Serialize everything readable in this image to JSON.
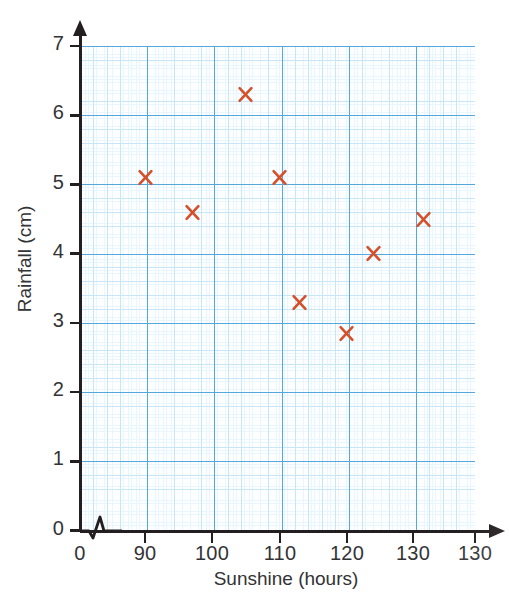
{
  "figure": {
    "kind": "scatter-graph",
    "background_color": "#ffffff",
    "grid_major_color": "#55a8de",
    "grid_medium_color": "#c9e6f7",
    "grid_fine_color": "#eaf6fd",
    "axis_color": "#231f20",
    "marker_color": "#d4502a",
    "axis_break_symbol": "zigzag"
  },
  "chart_data": {
    "type": "scatter",
    "title": "",
    "xlabel": "Sunshine (hours)",
    "ylabel": "Rainfall (cm)",
    "xlim": [
      85,
      143.5
    ],
    "ylim": [
      0,
      7
    ],
    "grid": true,
    "legend": "none",
    "x_tick_labels": [
      "0",
      "90",
      "100",
      "110",
      "120",
      "130",
      "130"
    ],
    "y_tick_labels": [
      "0",
      "1",
      "2",
      "3",
      "4",
      "5",
      "6",
      "7"
    ],
    "x_axis_break_after_origin": true,
    "marker_style": "x",
    "marker_color": "#d4502a",
    "points": [
      {
        "x": 90,
        "y": 5.1,
        "label": "90, 5.1"
      },
      {
        "x": 97,
        "y": 4.6,
        "label": "97, 4.6"
      },
      {
        "x": 105,
        "y": 6.3,
        "label": "105, 6.3"
      },
      {
        "x": 110,
        "y": 5.1,
        "label": "110, 5.1"
      },
      {
        "x": 113,
        "y": 3.3,
        "label": "113, 3.3"
      },
      {
        "x": 120,
        "y": 2.85,
        "label": "120, 2.85"
      },
      {
        "x": 124,
        "y": 4.0,
        "label": "124, 4.0"
      },
      {
        "x": 131.5,
        "y": 4.5,
        "label": "131.5, 4.5"
      }
    ]
  },
  "axes": {
    "y": {
      "title": "Rainfall (cm)",
      "ticks": [
        {
          "label": "7",
          "value": 7
        },
        {
          "label": "6",
          "value": 6
        },
        {
          "label": "5",
          "value": 5
        },
        {
          "label": "4",
          "value": 4
        },
        {
          "label": "3",
          "value": 3
        },
        {
          "label": "2",
          "value": 2
        },
        {
          "label": "1",
          "value": 1
        },
        {
          "label": "0",
          "value": 0
        }
      ]
    },
    "x": {
      "title": "Sunshine (hours)",
      "ticks": [
        {
          "label": "0",
          "px": 80
        },
        {
          "label": "90",
          "px": 145
        },
        {
          "label": "100",
          "px": 212
        },
        {
          "label": "110",
          "px": 280
        },
        {
          "label": "120",
          "px": 347
        },
        {
          "label": "130",
          "px": 413
        },
        {
          "label": "130",
          "px": 475
        }
      ]
    }
  }
}
